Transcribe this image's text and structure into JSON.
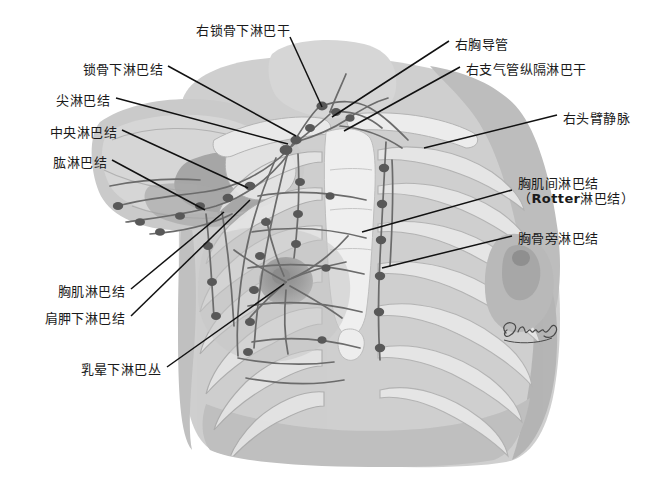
{
  "figure": {
    "type": "anatomical-illustration",
    "style": "grayscale",
    "signature": "Gamma"
  },
  "palette": {
    "background": "#ffffff",
    "ink": "#1a1a1a",
    "skin_light": "#d9d9d9",
    "skin_mid": "#c2c2c2",
    "skin_dark": "#a8a8a8",
    "bone_light": "#ededed",
    "bone_mid": "#dcdcdc",
    "vessel": "#6f6f6f",
    "node": "#5a5a5a",
    "areola": "#9a9a9a"
  },
  "labels_left": [
    {
      "id": "subclavian-lymph-nodes",
      "text": "锁骨下淋巴结",
      "x": 160,
      "y": 70,
      "tip_x": 292,
      "tip_y": 134
    },
    {
      "id": "apical-lymph-nodes",
      "text": "尖淋巴结",
      "x": 107,
      "y": 101,
      "tip_x": 288,
      "tip_y": 139
    },
    {
      "id": "central-lymph-nodes",
      "text": "中央淋巴结",
      "x": 114,
      "y": 133,
      "tip_x": 247,
      "tip_y": 185
    },
    {
      "id": "brachial-lymph-nodes",
      "text": "肱淋巴结",
      "x": 104,
      "y": 163,
      "tip_x": 208,
      "tip_y": 214
    },
    {
      "id": "pectoral-lymph-nodes",
      "text": "胸肌淋巴结",
      "x": 122,
      "y": 292,
      "tip_x": 225,
      "tip_y": 214
    },
    {
      "id": "subscapular-lymph-nodes",
      "text": "肩胛下淋巴结",
      "x": 122,
      "y": 319,
      "tip_x": 248,
      "tip_y": 201
    },
    {
      "id": "subareolar-plexus",
      "text": "乳晕下淋巴丛",
      "x": 158,
      "y": 370,
      "tip_x": 285,
      "tip_y": 284
    }
  ],
  "labels_top": [
    {
      "id": "right-subclavian-trunk",
      "text": "右锁骨下淋巴干",
      "x": 192,
      "y": 30,
      "tip_x": 320,
      "tip_y": 107
    }
  ],
  "labels_right": [
    {
      "id": "right-thoracic-duct",
      "text": "右胸导管",
      "x": 455,
      "y": 44,
      "tip_x": 332,
      "tip_y": 116
    },
    {
      "id": "right-bronchomediastinal-trunk",
      "text": "右支气管纵隔淋巴干",
      "x": 466,
      "y": 69,
      "tip_x": 340,
      "tip_y": 130
    },
    {
      "id": "right-brachiocephalic-vein",
      "text": "右头臂静脉",
      "x": 563,
      "y": 118,
      "tip_x": 425,
      "tip_y": 147
    },
    {
      "id": "interpectoral-rotter-nodes",
      "text": "胸肌间淋巴结",
      "sub_prefix": "（",
      "sub_bold": "Rotter",
      "sub_suffix": "淋巴结）",
      "x": 518,
      "y": 183,
      "tip_x": 362,
      "tip_y": 232
    },
    {
      "id": "parasternal-lymph-nodes",
      "text": "胸骨旁淋巴结",
      "x": 518,
      "y": 238,
      "tip_x": 380,
      "tip_y": 267
    }
  ],
  "node_markers": {
    "count_visible": 34,
    "description": "dark oval lymph nodes distributed along lymphatic vessels of axilla, chest wall and parasternal chain"
  }
}
